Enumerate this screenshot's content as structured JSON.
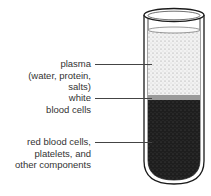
{
  "diagram": {
    "labels": [
      {
        "id": "plasma",
        "lines": [
          "plasma",
          "(water, protein,",
          "salts)"
        ]
      },
      {
        "id": "white",
        "lines": [
          "white",
          "blood cells"
        ]
      },
      {
        "id": "red",
        "lines": [
          "red blood cells,",
          "platelets, and",
          "other components"
        ]
      }
    ],
    "colors": {
      "plasma": "#e6e6e6",
      "white_band": "#9a9a9a",
      "red_layer": "#262626",
      "outline": "#1a1a1a"
    }
  }
}
